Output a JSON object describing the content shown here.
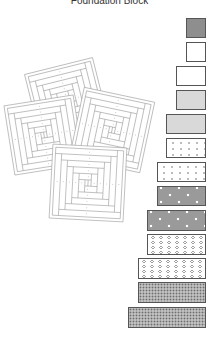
{
  "title": "Foundation Block",
  "colors": {
    "outline": "#9a9a9a",
    "strip_border": "#555555",
    "dark_gray": "#8e8e8e",
    "light_gray": "#d9d9d9"
  },
  "quilt_blocks": [
    {
      "name": "back-block",
      "cx": 67,
      "cy": 100,
      "size": 70,
      "rotate": -14
    },
    {
      "name": "left-block",
      "cx": 44,
      "cy": 135,
      "size": 70,
      "rotate": -9
    },
    {
      "name": "right-block",
      "cx": 112,
      "cy": 130,
      "size": 72,
      "rotate": 12
    },
    {
      "name": "front-block",
      "cx": 88,
      "cy": 183,
      "size": 74,
      "rotate": 3
    }
  ],
  "strips": [
    {
      "label": "strip-1",
      "fabric": "dark-gray",
      "x": 186,
      "y": 18,
      "w": 20,
      "h": 20
    },
    {
      "label": "strip-2",
      "fabric": "white",
      "x": 186,
      "y": 42,
      "w": 20,
      "h": 20
    },
    {
      "label": "strip-3",
      "fabric": "white",
      "x": 176,
      "y": 66,
      "w": 30,
      "h": 20
    },
    {
      "label": "strip-4",
      "fabric": "light-gray",
      "x": 176,
      "y": 90,
      "w": 30,
      "h": 20
    },
    {
      "label": "strip-5",
      "fabric": "light-gray",
      "x": 166,
      "y": 114,
      "w": 40,
      "h": 20
    },
    {
      "label": "strip-6",
      "fabric": "light-dots",
      "x": 166,
      "y": 138,
      "w": 40,
      "h": 20
    },
    {
      "label": "strip-7",
      "fabric": "light-dots",
      "x": 157,
      "y": 162,
      "w": 49,
      "h": 20
    },
    {
      "label": "strip-8",
      "fabric": "white-dots-on-gray",
      "x": 157,
      "y": 186,
      "w": 49,
      "h": 20
    },
    {
      "label": "strip-9",
      "fabric": "white-dots-on-gray",
      "x": 147,
      "y": 210,
      "w": 59,
      "h": 21
    },
    {
      "label": "strip-10",
      "fabric": "rings",
      "x": 147,
      "y": 234,
      "w": 59,
      "h": 21
    },
    {
      "label": "strip-11",
      "fabric": "rings",
      "x": 138,
      "y": 258,
      "w": 68,
      "h": 21
    },
    {
      "label": "strip-12",
      "fabric": "checker",
      "x": 138,
      "y": 282,
      "w": 68,
      "h": 21
    },
    {
      "label": "strip-13",
      "fabric": "checker",
      "x": 128,
      "y": 307,
      "w": 78,
      "h": 21
    }
  ]
}
